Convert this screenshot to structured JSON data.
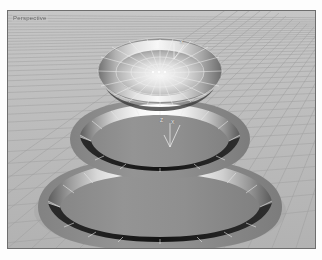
{
  "app": {
    "kind": "3d-modeling-viewport",
    "background_color": "#ffffff"
  },
  "viewport": {
    "label": "Perspective",
    "frame_color": "#6e6e6e",
    "floor_color": "#b9b9b9",
    "grid_line_color": "#9a9a9a",
    "grid_line_color_minor": "#a8a8a8",
    "x": 7,
    "y": 10,
    "width": 307,
    "height": 237
  },
  "gizmos": [
    {
      "name": "top-axis-gizmo",
      "x_label": "X",
      "z_label": "",
      "cx": 171,
      "cy": 37
    },
    {
      "name": "mid-axis-gizmo",
      "x_label": "X",
      "z_label": "Z",
      "cx": 166,
      "cy": 120
    }
  ],
  "object": {
    "name": "three-tier-stepped-cone",
    "tiers": 3,
    "body_color": "#8e8e8e",
    "band_highlight_color": "#fbfbfb",
    "band_shadow_color": "#1e1e1e",
    "wireframe_color": "#efefef",
    "facet_count": 24
  },
  "colors": {
    "accent": "#efefef",
    "dark": "#1e1e1e",
    "mid_gray": "#8e8e8e",
    "light_gray": "#d6d6d6"
  }
}
